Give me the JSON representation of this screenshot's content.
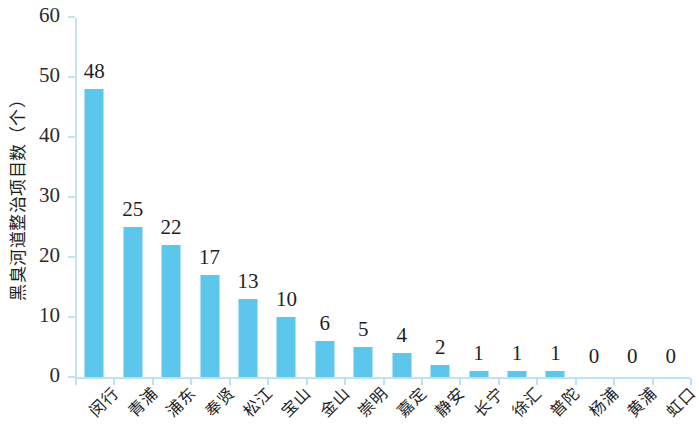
{
  "chart_data": {
    "type": "bar",
    "title": "",
    "xlabel": "",
    "ylabel": "黑臭河道整治项目数（个）",
    "ylim": [
      0,
      60
    ],
    "yticks": [
      0,
      10,
      20,
      30,
      40,
      50,
      60
    ],
    "grid": false,
    "legend": null,
    "bar_color": "#5cc6ec",
    "axis_color": "#bfe2f0",
    "show_value_labels": true,
    "categories": [
      "闵行",
      "青浦",
      "浦东",
      "奉贤",
      "松江",
      "宝山",
      "金山",
      "崇明",
      "嘉定",
      "静安",
      "长宁",
      "徐汇",
      "普陀",
      "杨浦",
      "黄浦",
      "虹口"
    ],
    "values": [
      48,
      25,
      22,
      17,
      13,
      10,
      6,
      5,
      4,
      2,
      1,
      1,
      1,
      0,
      0,
      0
    ]
  }
}
